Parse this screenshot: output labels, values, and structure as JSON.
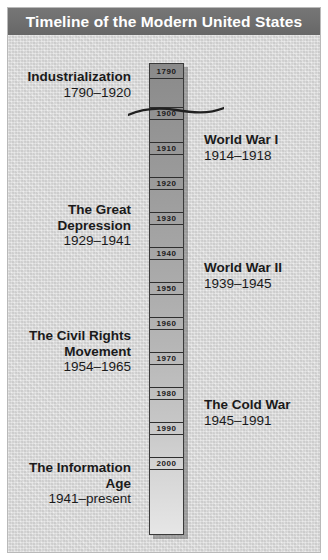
{
  "header": {
    "title": "Timeline of the Modern United States"
  },
  "colors": {
    "titlebar_bg": "#6e6e6e",
    "titlebar_text": "#ffffff",
    "background": "#d9d9d9",
    "column_top": "#8a8a8a",
    "column_bottom": "#e6e6e6",
    "column_border": "#3a3a3a",
    "text": "#1a1a1a"
  },
  "timeline": {
    "orientation": "vertical",
    "break_after_index": 0,
    "break_note": "wavy break line between 1790 and 1900 indicating compressed time",
    "year_markers": [
      {
        "label": "1790"
      },
      {
        "label": "1900"
      },
      {
        "label": "1910"
      },
      {
        "label": "1920"
      },
      {
        "label": "1930"
      },
      {
        "label": "1940"
      },
      {
        "label": "1950"
      },
      {
        "label": "1960"
      },
      {
        "label": "1970"
      },
      {
        "label": "1980"
      },
      {
        "label": "1990"
      },
      {
        "label": "2000"
      }
    ]
  },
  "eras": [
    {
      "side": "left",
      "name": "Industrialization",
      "dates": "1790–1920"
    },
    {
      "side": "right",
      "name": "World War I",
      "dates": "1914–1918"
    },
    {
      "side": "left",
      "name": "The Great\nDepression",
      "dates": "1929–1941"
    },
    {
      "side": "right",
      "name": "World War II",
      "dates": "1939–1945"
    },
    {
      "side": "left",
      "name": "The Civil Rights\nMovement",
      "dates": "1954–1965"
    },
    {
      "side": "right",
      "name": "The Cold War",
      "dates": "1945–1991"
    },
    {
      "side": "left",
      "name": "The Information\nAge",
      "dates": "1941–present"
    }
  ]
}
